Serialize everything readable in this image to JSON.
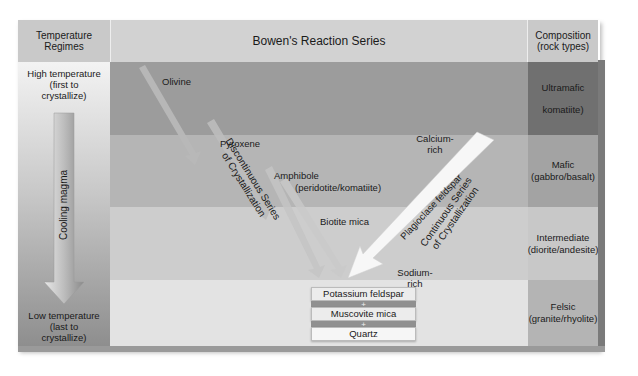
{
  "headers": {
    "temperature": "Temperature Regimes",
    "series": "Bowen's Reaction Series",
    "composition": "Composition (rock types)"
  },
  "temperature_column": {
    "high": [
      "High temperature",
      "(first to",
      "crystallize)"
    ],
    "cooling": "Cooling magma",
    "low": [
      "Low temperature",
      "(last to",
      "crystallize)"
    ]
  },
  "minerals": {
    "olivine": "Olivine",
    "pyroxene": "Pyroxene",
    "amphibole": "Amphibole",
    "amphibole_note": "(peridotite/komatiite)",
    "biotite": "Biotite mica",
    "calcium_rich": [
      "Calcium-",
      "rich"
    ],
    "sodium_rich": [
      "Sodium-",
      "rich"
    ],
    "plagioclase": "Plagioclase feldspar"
  },
  "series_labels": {
    "discontinuous": [
      "Discontinuous Series",
      "of Crystallization"
    ],
    "continuous": [
      "Continuous Series",
      "of Crystallization"
    ]
  },
  "final_products": [
    "Potassium feldspar",
    "+",
    "Muscovite mica",
    "+",
    "Quartz"
  ],
  "composition": [
    {
      "name": "Ultramafic",
      "rocks": "komatiite)"
    },
    {
      "name": "Mafic",
      "rocks": "(gabbro/basalt)"
    },
    {
      "name": "Intermediate",
      "rocks": "(diorite/andesite)"
    },
    {
      "name": "Felsic",
      "rocks": "(granite/rhyolite)"
    }
  ]
}
